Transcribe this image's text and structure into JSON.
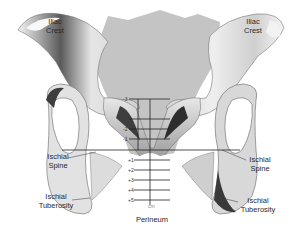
{
  "diagram": {
    "type": "anatomical-diagram",
    "labels": {
      "iliac_crest_left": [
        "Iliac",
        "Crest"
      ],
      "iliac_crest_right": [
        "Iliac",
        "Crest"
      ],
      "ischial_spine_left": [
        "Ischial",
        "Spine"
      ],
      "ischial_spine_right": [
        "Ischial",
        "Spine"
      ],
      "ischial_tuberosity_left": [
        "Ischial",
        "Tuberosity"
      ],
      "ischial_tuberosity_right": [
        "Ischial",
        "Tuberosity"
      ],
      "perineum": "Perineum"
    },
    "station_scale": {
      "above": [
        "-3",
        "-2",
        "-1"
      ],
      "zero_line": "0",
      "below": [
        "+1",
        "+2",
        "+3",
        "+4",
        "+5"
      ],
      "unit": "cm"
    },
    "colors": {
      "bone_light": "#e8e8e8",
      "bone_shadow": "#4a4a4a",
      "sacrum_gray": "#bdbdbd",
      "line": "#222222",
      "background": "#ffffff"
    }
  }
}
